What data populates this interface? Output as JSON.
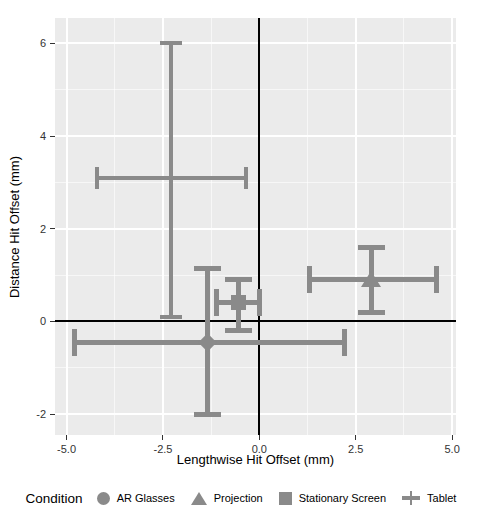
{
  "chart_data": {
    "type": "scatter",
    "title": "",
    "xlabel": "Lengthwise Hit Offset (mm)",
    "ylabel": "Distance Hit Offset (mm)",
    "xlim": [
      -5.3,
      5.1
    ],
    "ylim": [
      -2.45,
      6.55
    ],
    "x_tick_values": [
      -5,
      -2.5,
      0,
      2.5,
      5
    ],
    "x_tick_labels": [
      "-5.0",
      "-2.5",
      "0.0",
      "2.5",
      "5.0"
    ],
    "y_tick_values": [
      6,
      4,
      2,
      0,
      -2
    ],
    "y_tick_labels": [
      "6",
      "4",
      "2",
      "0",
      "-2"
    ],
    "reference_lines": {
      "x": 0,
      "y": 0
    },
    "grid": {
      "panel_bg": "#ebebeb",
      "major": "#ffffff",
      "minor": "rgba(255,255,255,0.6)",
      "major_on": true,
      "minor_on": true
    },
    "legend_position": "bottom",
    "series": [
      {
        "name": "AR Glasses",
        "marker": "diamond",
        "x": -1.35,
        "y": -0.45,
        "x_err": [
          -4.8,
          2.2
        ],
        "y_err": [
          -2.0,
          1.15
        ]
      },
      {
        "name": "Projection",
        "marker": "triangle",
        "x": 2.9,
        "y": 0.9,
        "x_err": [
          1.3,
          4.6
        ],
        "y_err": [
          0.2,
          1.6
        ]
      },
      {
        "name": "Stationary Screen",
        "marker": "square",
        "x": -0.55,
        "y": 0.4,
        "x_err": [
          -1.1,
          0.0
        ],
        "y_err": [
          -0.2,
          0.9
        ]
      },
      {
        "name": "Tablet",
        "marker": "plus",
        "x": -2.3,
        "y": 3.1,
        "x_err": [
          -4.2,
          -0.35
        ],
        "y_err": [
          0.1,
          6.0
        ]
      }
    ],
    "marker_color": "#8a8a8a",
    "axis_line_color": "#000000"
  },
  "legend": {
    "title": "Condition",
    "items": [
      {
        "label": "AR Glasses",
        "shape": "circle"
      },
      {
        "label": "Projection",
        "shape": "triangle"
      },
      {
        "label": "Stationary Screen",
        "shape": "square"
      },
      {
        "label": "Tablet",
        "shape": "plus"
      }
    ]
  }
}
